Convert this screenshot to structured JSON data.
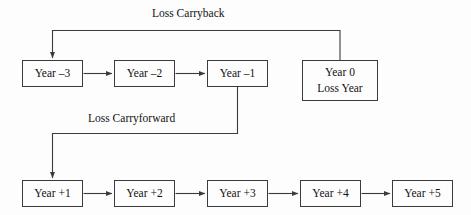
{
  "diagram": {
    "background_color": "#fdfdfd",
    "line_color": "#3b3b3b",
    "text_color": "#111111",
    "nodes": [
      {
        "id": "year-minus-3",
        "line1": "Year –3",
        "line2": "",
        "x": 22,
        "y": 60,
        "w": 61,
        "h": 27
      },
      {
        "id": "year-minus-2",
        "line1": "Year –2",
        "line2": "",
        "x": 114,
        "y": 60,
        "w": 61,
        "h": 27
      },
      {
        "id": "year-minus-1",
        "line1": "Year –1",
        "line2": "",
        "x": 207,
        "y": 60,
        "w": 61,
        "h": 27
      },
      {
        "id": "year-0",
        "line1": "Year 0",
        "line2": "Loss Year",
        "x": 302,
        "y": 60,
        "w": 76,
        "h": 41
      },
      {
        "id": "year-plus-1",
        "line1": "Year +1",
        "line2": "",
        "x": 22,
        "y": 180,
        "w": 61,
        "h": 27
      },
      {
        "id": "year-plus-2",
        "line1": "Year +2",
        "line2": "",
        "x": 114,
        "y": 180,
        "w": 61,
        "h": 27
      },
      {
        "id": "year-plus-3",
        "line1": "Year +3",
        "line2": "",
        "x": 207,
        "y": 180,
        "w": 61,
        "h": 27
      },
      {
        "id": "year-plus-4",
        "line1": "Year +4",
        "line2": "",
        "x": 300,
        "y": 180,
        "w": 61,
        "h": 27
      },
      {
        "id": "year-plus-5",
        "line1": "Year +5",
        "line2": "",
        "x": 392,
        "y": 180,
        "w": 61,
        "h": 27
      }
    ],
    "edge_labels": [
      {
        "id": "loss-carryback-label",
        "text": "Loss Carryback",
        "x": 152,
        "y": 7
      },
      {
        "id": "loss-carryforward-label",
        "text": "Loss Carryforward",
        "x": 88,
        "y": 112
      }
    ],
    "connectors": [
      {
        "id": "arrow-y3-to-y2",
        "type": "horizontal-arrow",
        "from": "year-minus-3",
        "to": "year-minus-2"
      },
      {
        "id": "arrow-y2-to-y1",
        "type": "horizontal-arrow",
        "from": "year-minus-2",
        "to": "year-minus-1"
      },
      {
        "id": "arrow-p1-to-p2",
        "type": "horizontal-arrow",
        "from": "year-plus-1",
        "to": "year-plus-2"
      },
      {
        "id": "arrow-p2-to-p3",
        "type": "horizontal-arrow",
        "from": "year-plus-2",
        "to": "year-plus-3"
      },
      {
        "id": "arrow-p3-to-p4",
        "type": "horizontal-arrow",
        "from": "year-plus-3",
        "to": "year-plus-4"
      },
      {
        "id": "arrow-p4-to-p5",
        "type": "horizontal-arrow",
        "from": "year-plus-4",
        "to": "year-plus-5"
      },
      {
        "id": "carryback-path",
        "type": "elbow-arrow",
        "from": "year-0",
        "to": "year-minus-3",
        "label": "Loss Carryback"
      },
      {
        "id": "carryforward-path",
        "type": "elbow-arrow",
        "from": "year-minus-1",
        "to": "year-plus-1",
        "label": "Loss Carryforward"
      }
    ]
  }
}
